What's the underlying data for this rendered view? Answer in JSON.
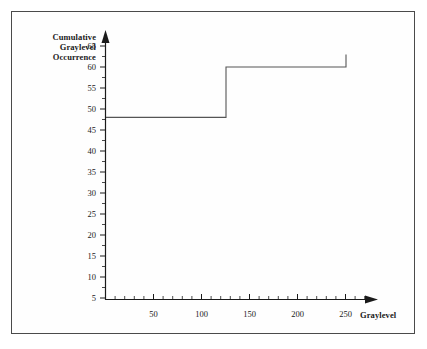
{
  "chart_data": {
    "type": "line",
    "title": "",
    "subtitle": "",
    "xlabel": "Graylevel",
    "ylabel": "Cumulative Graylevel Occurrence",
    "ylabel_lines": [
      "Cumulative",
      "Graylevel",
      "Occurrence"
    ],
    "xlim": [
      0,
      270
    ],
    "ylim": [
      0,
      67
    ],
    "x_major_ticks": [
      50,
      100,
      150,
      200,
      250
    ],
    "x_tick_labels": [
      "50",
      "100",
      "150",
      "200",
      "250"
    ],
    "x_minor_tick_step": 10,
    "y_major_ticks": [
      5,
      10,
      15,
      20,
      25,
      30,
      35,
      40,
      45,
      50,
      55,
      60,
      65
    ],
    "y_tick_labels": [
      "5",
      "10",
      "15",
      "20",
      "25",
      "30",
      "35",
      "40",
      "45",
      "50",
      "55",
      "60",
      "65"
    ],
    "y_minor_tick_step": 2.5,
    "grid": false,
    "legend": null,
    "axis_arrows": true,
    "series": [
      {
        "name": "Cumulative Graylevel Occurrence",
        "type": "step",
        "color": "#555555",
        "points": [
          {
            "x": 0,
            "y": 48
          },
          {
            "x": 125,
            "y": 48
          },
          {
            "x": 125,
            "y": 60
          },
          {
            "x": 250,
            "y": 60
          },
          {
            "x": 250,
            "y": 63
          }
        ]
      }
    ],
    "annotations": []
  },
  "labels": {
    "ylabel_line1": "Cumulative",
    "ylabel_line2": "Graylevel",
    "ylabel_line3": "Occurrence",
    "xlabel": "Graylevel"
  },
  "colors": {
    "curve": "#555555",
    "axis": "#1a1a1a",
    "frame": "#4a4a4a",
    "background": "#ffffff",
    "text": "#1a1a1a"
  }
}
